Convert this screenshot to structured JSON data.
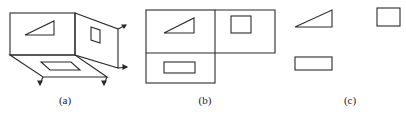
{
  "figure": {
    "panels": [
      {
        "id": "a",
        "caption": "(a)",
        "description": "3D box with triangle on front plane, rectangle on side plane, rectangle on floor plane; arrows indicate unfolding"
      },
      {
        "id": "b",
        "caption": "(b)",
        "description": "Unfolded planes: triangle top-left, square top-right, rectangle bottom-left"
      },
      {
        "id": "c",
        "caption": "(c)",
        "description": "Three views without plane borders: triangle, square, rectangle"
      }
    ],
    "colors": {
      "line": "#2a2a2a",
      "background": "#ffffff"
    }
  }
}
